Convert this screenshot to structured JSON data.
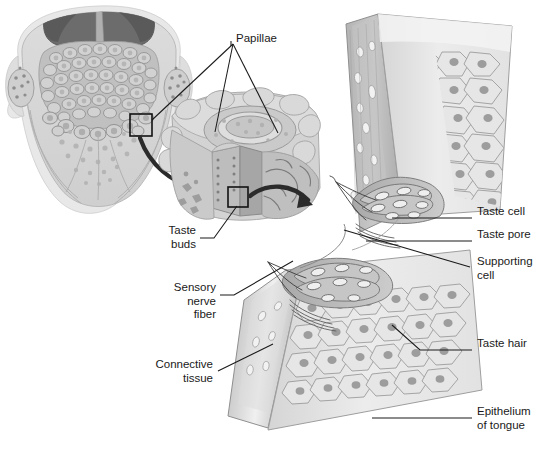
{
  "figure": {
    "background_color": "#ffffff",
    "width": 539,
    "height": 450
  },
  "palette": {
    "line": "#1a1a1a",
    "tissue_light": "#e3e3e3",
    "tissue_mid": "#c9c9c9",
    "tissue_dark": "#a8a8a8",
    "tissue_darker": "#8d8d8d",
    "cavity_dark": "#6f6f6f",
    "cavity_darkest": "#585858",
    "epithelium_fill": "#e9e9e9",
    "nucleus": "#9a9a9a",
    "connective_fill": "#c2c2c2",
    "highlight": "#f4f4f4",
    "label_text": "#1a1a1a"
  },
  "labels": [
    {
      "id": "papillae",
      "name": "papillae-label",
      "text": "Papillae",
      "align": "left",
      "x": 236,
      "y": 38,
      "leader_origin": [
        232,
        45
      ],
      "leaders": [
        [
          232,
          45,
          152,
          120
        ],
        [
          232,
          45,
          215,
          130
        ],
        [
          232,
          45,
          278,
          132
        ]
      ]
    },
    {
      "id": "taste-cell",
      "name": "taste-cell-label",
      "text": "Taste cell",
      "align": "left",
      "x": 477,
      "y": 212,
      "leader": [
        474,
        218,
        393,
        218
      ]
    },
    {
      "id": "taste-pore",
      "name": "taste-pore-label",
      "text": "Taste pore",
      "align": "left",
      "x": 477,
      "y": 235,
      "leader": [
        474,
        241,
        368,
        241
      ]
    },
    {
      "id": "supporting-cell",
      "name": "supporting-cell-label",
      "text": "Supporting\ncell",
      "align": "left",
      "x": 477,
      "y": 262,
      "leader": [
        472,
        268,
        345,
        231
      ]
    },
    {
      "id": "taste-hair",
      "name": "taste-hair-label",
      "text": "Taste hair",
      "align": "left",
      "x": 477,
      "y": 344,
      "leader": [
        474,
        350,
        420,
        350,
        392,
        325
      ]
    },
    {
      "id": "epithelium",
      "name": "epithelium-of-tongue-label",
      "text": "Epithelium\nof tongue",
      "align": "left",
      "x": 477,
      "y": 412,
      "leader": [
        474,
        418,
        373,
        418
      ]
    },
    {
      "id": "taste-buds",
      "name": "taste-buds-label",
      "text": "Taste\nbuds",
      "align": "right",
      "x": 196,
      "y": 231,
      "leader": [
        199,
        238,
        212,
        238,
        236,
        205
      ]
    },
    {
      "id": "sensory-nerve-fiber",
      "name": "sensory-nerve-fiber-label",
      "text": "Sensory\nnerve\nfiber",
      "align": "right",
      "x": 216,
      "y": 288,
      "leader": [
        219,
        295,
        232,
        295,
        292,
        262
      ]
    },
    {
      "id": "connective-tissue",
      "name": "connective-tissue-label",
      "text": "Connective\ntissue",
      "align": "right",
      "x": 213,
      "y": 365,
      "leader": [
        216,
        371,
        272,
        345
      ]
    }
  ],
  "panels": [
    {
      "id": "whole-tongue",
      "name": "whole-tongue-panel",
      "caption": "Dorsal surface of tongue with circumvallate and fungiform papillae",
      "zoom_box": [
        130,
        114,
        22,
        22
      ]
    },
    {
      "id": "papilla-block",
      "name": "papilla-block-panel",
      "caption": "Enlarged block of tongue surface showing a circumvallate papilla",
      "zoom_box": [
        228,
        187,
        20,
        20
      ]
    },
    {
      "id": "taste-bud-section",
      "name": "taste-bud-section-panel",
      "caption": "Section through epithelium showing taste buds, taste cells and taste pores"
    }
  ]
}
